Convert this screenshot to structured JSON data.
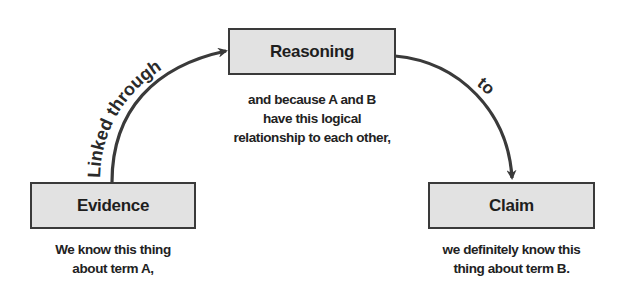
{
  "diagram": {
    "nodes": {
      "reasoning": {
        "label": "Reasoning",
        "caption": [
          "and because A and B",
          "have this logical",
          "relationship to each other,"
        ]
      },
      "evidence": {
        "label": "Evidence",
        "caption": [
          "We know this thing",
          "about term A,"
        ]
      },
      "claim": {
        "label": "Claim",
        "caption": [
          "we definitely know this",
          "thing about term B."
        ]
      }
    },
    "edges": [
      {
        "from": "evidence",
        "to": "reasoning",
        "label": "Linked through"
      },
      {
        "from": "reasoning",
        "to": "claim",
        "label": "to"
      }
    ],
    "colors": {
      "box_fill": "#e2e2e2",
      "box_border": "#3a3a3a",
      "arrow": "#3a3a3a",
      "text": "#1e1e1e"
    }
  }
}
